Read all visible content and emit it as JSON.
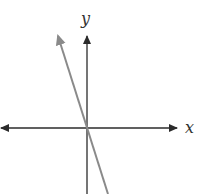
{
  "diagram": {
    "type": "coordinate-plane",
    "x_axis": {
      "label": "x",
      "color": "#2b2b2b",
      "arrows": "both"
    },
    "y_axis": {
      "label": "y",
      "color": "#2b2b2b",
      "arrows": "up"
    },
    "line": {
      "color": "#8a8a8a",
      "passes_through_origin": true,
      "slope_sign": "negative",
      "arrow_end": "upper-left"
    }
  }
}
